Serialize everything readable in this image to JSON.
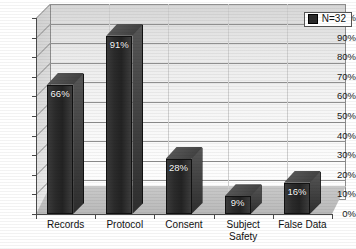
{
  "chart_data": {
    "type": "bar",
    "title": "",
    "subtitle": "",
    "xlabel": "",
    "ylabel": "",
    "categories": [
      "Records",
      "Protocol",
      "Consent",
      "Subject Safety",
      "False Data"
    ],
    "values": [
      66,
      91,
      28,
      9,
      16
    ],
    "data_labels": [
      "66%",
      "91%",
      "28%",
      "9%",
      "16%"
    ],
    "ylim": [
      0,
      100
    ],
    "y_ticks": [
      0,
      10,
      20,
      30,
      40,
      50,
      60,
      70,
      80,
      90,
      100
    ],
    "y_tick_labels": [
      "0%",
      "10%",
      "20%",
      "30%",
      "40%",
      "50%",
      "60%",
      "70%",
      "80%",
      "90%",
      "100%"
    ],
    "grid": true,
    "legend": {
      "position": "top-right",
      "entries": [
        {
          "label": "N=32",
          "color": "#2b2b2b",
          "marker": "square"
        }
      ]
    },
    "series": [
      {
        "name": "N=32",
        "color": "#2b2b2b",
        "values": [
          66,
          91,
          28,
          9,
          16
        ]
      }
    ],
    "style": {
      "three_d": true,
      "palette": "grayscale",
      "bar_color": "#2b2b2b",
      "plot_background": "#efefef",
      "floor_color": "#c1c1c1",
      "axis_color": "#4a4a4a",
      "gridline_color": "#8f8f8f",
      "label_text_color": "#ffffff"
    }
  },
  "category_lines": {
    "Records": [
      "Records"
    ],
    "Protocol": [
      "Protocol"
    ],
    "Consent": [
      "Consent"
    ],
    "Subject Safety": [
      "Subject",
      "Safety"
    ],
    "False Data": [
      "False Data"
    ]
  }
}
